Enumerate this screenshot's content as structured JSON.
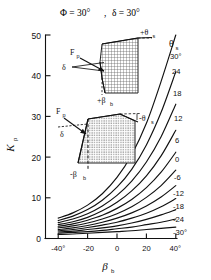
{
  "figure": {
    "title_phi": "Φ = 30°",
    "title_sep": ",",
    "title_delta": "δ = 30°"
  },
  "chart_data": {
    "type": "line",
    "title": "Φ = 30° , δ = 30°",
    "xlabel": "βb",
    "ylabel": "Kp",
    "xlim": [
      -45,
      45
    ],
    "ylim": [
      0,
      50
    ],
    "grid": false,
    "legend_position": "right-of-curves",
    "legend_title": "θs",
    "xticks": [
      -40,
      -20,
      0,
      20,
      40
    ],
    "xticklabels": [
      "-40°",
      "-20",
      "0",
      "20",
      "40°"
    ],
    "yticks": [
      0,
      10,
      20,
      30,
      40,
      50
    ],
    "yticklabels": [
      "0",
      "10",
      "20",
      "30",
      "40",
      "50"
    ],
    "x": [
      -45,
      -40,
      -30,
      -20,
      -10,
      0,
      10,
      20,
      30,
      40,
      45
    ],
    "series": [
      {
        "name": "30°",
        "theta_s": 30,
        "values": [
          4.6,
          5.0,
          6.3,
          8.2,
          11.0,
          15.0,
          20.6,
          28.3,
          38.6,
          50.0,
          55.0
        ]
      },
      {
        "name": "24",
        "theta_s": 24,
        "values": [
          4.1,
          4.4,
          5.5,
          7.1,
          9.4,
          12.6,
          17.0,
          23.0,
          31.0,
          41.0,
          45.5
        ]
      },
      {
        "name": "18",
        "theta_s": 18,
        "values": [
          3.6,
          3.9,
          4.8,
          6.1,
          8.0,
          10.6,
          14.1,
          18.8,
          25.0,
          33.0,
          36.5
        ]
      },
      {
        "name": "12",
        "theta_s": 12,
        "values": [
          3.2,
          3.4,
          4.1,
          5.2,
          6.8,
          8.9,
          11.7,
          15.4,
          20.3,
          26.6,
          29.4
        ]
      },
      {
        "name": "6",
        "theta_s": 6,
        "values": [
          2.8,
          3.0,
          3.6,
          4.5,
          5.7,
          7.4,
          9.6,
          12.5,
          16.3,
          21.2,
          23.4
        ]
      },
      {
        "name": "0",
        "theta_s": 0,
        "values": [
          2.4,
          2.6,
          3.1,
          3.8,
          4.8,
          6.1,
          7.8,
          10.1,
          13.0,
          16.8,
          18.5
        ]
      },
      {
        "name": "-6",
        "theta_s": -6,
        "values": [
          2.1,
          2.2,
          2.6,
          3.2,
          4.0,
          5.0,
          6.3,
          8.0,
          10.2,
          13.0,
          14.3
        ]
      },
      {
        "name": "-12",
        "theta_s": -12,
        "values": [
          1.8,
          1.9,
          2.2,
          2.7,
          3.3,
          4.0,
          5.0,
          6.2,
          7.8,
          9.8,
          10.8
        ]
      },
      {
        "name": "-18",
        "theta_s": -18,
        "values": [
          1.5,
          1.6,
          1.8,
          2.2,
          2.6,
          3.1,
          3.8,
          4.7,
          5.8,
          7.1,
          7.8
        ]
      },
      {
        "name": "-24",
        "theta_s": -24,
        "values": [
          1.2,
          1.3,
          1.5,
          1.7,
          2.0,
          2.4,
          2.8,
          3.4,
          4.0,
          4.8,
          5.2
        ]
      },
      {
        "name": "-30°",
        "theta_s": -30,
        "values": [
          0.9,
          1.0,
          1.1,
          1.3,
          1.5,
          1.7,
          1.9,
          2.2,
          2.5,
          2.8,
          3.0
        ]
      }
    ],
    "curve_labels": [
      "30°",
      "24",
      "18",
      "12",
      "6",
      "0",
      "-6",
      "-12",
      "-18",
      "-24",
      "-30°"
    ]
  },
  "legend": {
    "symbol": "θ",
    "symbol_sub": "s"
  },
  "axes": {
    "y_label_main": "K",
    "y_label_sub": "p",
    "x_label_main": "β",
    "x_label_sub": "b"
  },
  "inset_upper": {
    "name": "positive-wall-inclination-diagram",
    "theta_label": "+θ",
    "theta_sub": "s",
    "force_label": "F",
    "force_sub": "p",
    "delta_label": "δ",
    "beta_label": "+β",
    "beta_sub": "b"
  },
  "inset_lower": {
    "name": "negative-wall-inclination-diagram",
    "theta_label": "-θ",
    "theta_sub": "s",
    "force_label": "F",
    "force_sub": "p",
    "delta_label": "δ",
    "beta_label": "-β",
    "beta_sub": "b"
  }
}
